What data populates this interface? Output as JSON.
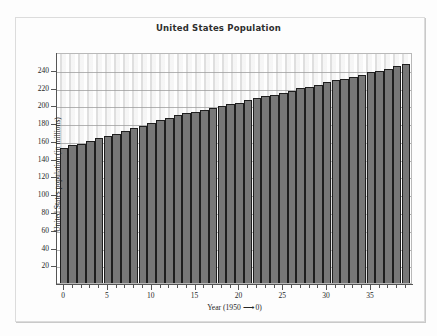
{
  "chart_data": {
    "type": "bar",
    "title": "United States Population",
    "xlabel": "Year (1950 ⟶ 0)",
    "ylabel": "United States population (in millions)",
    "xlim": [
      -0.8,
      39.8
    ],
    "ylim": [
      0,
      260
    ],
    "grid": true,
    "legend": "none",
    "bar_color": "#787878",
    "bar_edge_color": "#1f1f1f",
    "plot_background": "#f2f2f2",
    "y_ticks": [
      20,
      40,
      60,
      80,
      100,
      120,
      140,
      160,
      180,
      200,
      220,
      240
    ],
    "y_tick_labels": [
      "20",
      "40",
      "60",
      "80",
      "100",
      "120",
      "140",
      "160",
      "180",
      "200",
      "220",
      "240"
    ],
    "x_ticks_major": [
      0,
      5,
      10,
      15,
      20,
      25,
      30,
      35
    ],
    "x_tick_labels": [
      "0",
      "5",
      "10",
      "15",
      "20",
      "25",
      "30",
      "35"
    ],
    "x_minor_tick_interval": 1,
    "categories": [
      0,
      1,
      2,
      3,
      4,
      5,
      6,
      7,
      8,
      9,
      10,
      11,
      12,
      13,
      14,
      15,
      16,
      17,
      18,
      19,
      20,
      21,
      22,
      23,
      24,
      25,
      26,
      27,
      28,
      29,
      30,
      31,
      32,
      33,
      34,
      35,
      36,
      37,
      38,
      39
    ],
    "values": [
      152,
      155,
      157,
      160,
      163,
      166,
      168,
      171,
      174,
      177,
      180,
      183,
      186,
      189,
      191,
      193,
      195,
      197,
      199,
      201,
      203,
      206,
      208,
      210,
      212,
      214,
      216,
      219,
      221,
      223,
      226,
      228,
      230,
      232,
      234,
      237,
      239,
      241,
      244,
      247
    ]
  },
  "title_text": "United States Population",
  "axis": {
    "x_label_text": "Year (1950 ⟶ 0)",
    "y_label_text": "United States population (in millions)"
  }
}
